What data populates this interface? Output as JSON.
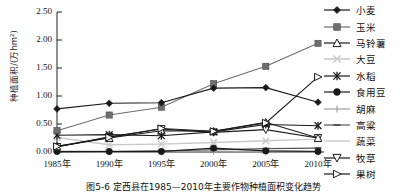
{
  "figure": {
    "caption": "图5-6  定西县在1985—2010年主要作物种植面积变化趋势",
    "ylabel": "种植面积/(万hm²)"
  },
  "axis": {
    "yticks": [
      "0.00",
      "0.50",
      "1.00",
      "1.50",
      "2.00",
      "2.50"
    ],
    "xticks": [
      "1985年",
      "1990年",
      "1995年",
      "2000年",
      "2005年",
      "2010年"
    ]
  },
  "chart_data": {
    "type": "line",
    "title": "图5-6  定西县在1985—2010年主要作物种植面积变化趋势",
    "xlabel": "",
    "ylabel": "种植面积/(万hm²)",
    "categories": [
      "1985年",
      "1990年",
      "1995年",
      "2000年",
      "2005年",
      "2010年"
    ],
    "ylim": [
      0.0,
      2.5
    ],
    "ytick_values": [
      0.0,
      0.5,
      1.0,
      1.5,
      2.0,
      2.5
    ],
    "grid": false,
    "legend_position": "right",
    "series": [
      {
        "name": "小麦",
        "marker": "filled-diamond",
        "color": "#1a1a1a",
        "values": [
          0.77,
          0.87,
          0.88,
          1.14,
          1.15,
          0.89
        ]
      },
      {
        "name": "玉米",
        "marker": "filled-square",
        "color": "#6e6e6e",
        "values": [
          0.38,
          0.66,
          0.8,
          1.22,
          1.53,
          1.94
        ]
      },
      {
        "name": "马铃薯",
        "marker": "open-triangle-up",
        "color": "#1a1a1a",
        "values": [
          0.1,
          0.25,
          0.38,
          0.37,
          0.53,
          0.25
        ]
      },
      {
        "name": "大豆",
        "marker": "light-x",
        "color": "#c9c9c9",
        "values": [
          0.26,
          0.13,
          0.14,
          0.17,
          0.2,
          0.23
        ]
      },
      {
        "name": "水稻",
        "marker": "asterisk",
        "color": "#1a1a1a",
        "values": [
          0.3,
          0.31,
          0.29,
          0.36,
          0.49,
          0.47
        ]
      },
      {
        "name": "食用豆",
        "marker": "filled-circle",
        "color": "#1a1a1a",
        "values": [
          0.01,
          0.01,
          0.01,
          0.07,
          0.02,
          0.01
        ]
      },
      {
        "name": "胡麻",
        "marker": "plus",
        "color": "#9a9a9a",
        "values": [
          0.01,
          0.01,
          0.01,
          0.01,
          0.0,
          0.0
        ]
      },
      {
        "name": "高粱",
        "marker": "dash",
        "color": "#555555",
        "values": [
          0.0,
          0.01,
          0.02,
          0.04,
          0.06,
          0.07
        ]
      },
      {
        "name": "蔬菜",
        "marker": "plain-line",
        "color": "#d0d0d0",
        "values": [
          0.02,
          0.02,
          0.02,
          0.02,
          0.02,
          0.02
        ]
      },
      {
        "name": "牧草",
        "marker": "open-triangle-down",
        "color": "#1a1a1a",
        "values": [
          0.09,
          0.27,
          0.41,
          0.35,
          0.4,
          0.25
        ]
      },
      {
        "name": "果树",
        "marker": "open-triangle-right",
        "color": "#1a1a1a",
        "values": [
          0.1,
          0.26,
          0.42,
          0.37,
          0.52,
          1.34
        ]
      }
    ]
  },
  "legend": {
    "items": [
      {
        "label": "小麦",
        "marker": "filled-diamond",
        "color": "#1a1a1a"
      },
      {
        "label": "玉米",
        "marker": "filled-square",
        "color": "#6e6e6e"
      },
      {
        "label": "马铃薯",
        "marker": "open-triangle-up",
        "color": "#1a1a1a"
      },
      {
        "label": "大豆",
        "marker": "light-x",
        "color": "#c9c9c9"
      },
      {
        "label": "水稻",
        "marker": "asterisk",
        "color": "#1a1a1a"
      },
      {
        "label": "食用豆",
        "marker": "filled-circle",
        "color": "#1a1a1a"
      },
      {
        "label": "胡麻",
        "marker": "plus",
        "color": "#9a9a9a"
      },
      {
        "label": "高粱",
        "marker": "dash",
        "color": "#555555"
      },
      {
        "label": "蔬菜",
        "marker": "plain-line",
        "color": "#d0d0d0"
      },
      {
        "label": "牧草",
        "marker": "open-triangle-down",
        "color": "#1a1a1a"
      },
      {
        "label": "果树",
        "marker": "open-triangle-right",
        "color": "#1a1a1a"
      }
    ]
  }
}
